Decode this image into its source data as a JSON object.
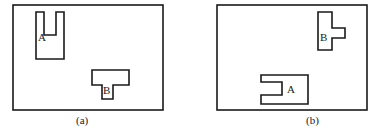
{
  "figure": {
    "panels": [
      {
        "caption": "(a)",
        "shapes": [
          {
            "label": "A",
            "kind": "U-shape, opening up"
          },
          {
            "label": "B",
            "kind": "T-shape, stem down"
          }
        ]
      },
      {
        "caption": "(b)",
        "shapes": [
          {
            "label": "B",
            "kind": "T-shape, stem right"
          },
          {
            "label": "A",
            "kind": "U-shape, opening left"
          }
        ]
      }
    ]
  }
}
